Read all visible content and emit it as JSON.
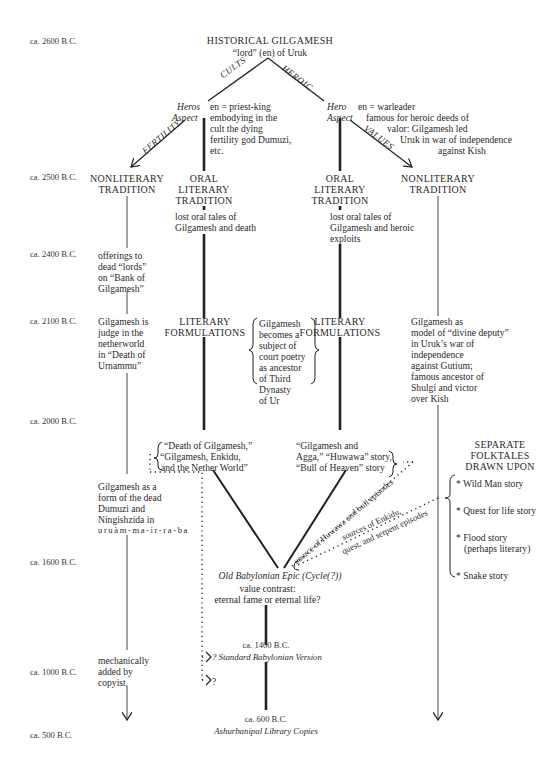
{
  "timeline": [
    {
      "label": "ca. 2600 B.C.",
      "y": 42
    },
    {
      "label": "ca. 2500 B.C.",
      "y": 178
    },
    {
      "label": "ca. 2400 B.C.",
      "y": 255
    },
    {
      "label": "ca. 2100 B.C.",
      "y": 321
    },
    {
      "label": "ca. 2000 B.C.",
      "y": 421
    },
    {
      "label": "ca. 1600 B.C.",
      "y": 563
    },
    {
      "label": "ca. 1000 B.C.",
      "y": 663
    },
    {
      "label": "ca. 500 B.C.",
      "y": 732
    }
  ],
  "root": {
    "title": "HISTORICAL GILGAMESH",
    "subtitle": "“lord” (en) of Uruk"
  },
  "branch_labels": {
    "cults": "CULTS",
    "heroic": "HEROIC",
    "fertility": "FERTILITY",
    "values": "VALUES"
  },
  "left_aspect": {
    "label_line1": "Heros",
    "label_line2": "Aspect",
    "desc": [
      "en = priest-king",
      "embodying in the",
      "cult the dying",
      "fertility god Dumuzi,",
      "etc."
    ]
  },
  "right_aspect": {
    "label_line1": "Hero",
    "label_line2": "Aspect",
    "desc": [
      "en = warleader",
      "famous for heroic deeds of",
      "valor: Gilgamesh led",
      "Uruk in war of independence",
      "against Kish"
    ]
  },
  "columns": {
    "nonliterary_left": {
      "title": [
        "NONLITERARY",
        "TRADITION"
      ],
      "c2400": [
        "offerings to",
        "dead “lords”",
        "on “Bank of",
        "Gilgamesh”"
      ],
      "c2100": [
        "Gilgamesh is",
        "judge in the",
        "netherworld",
        "in “Death of",
        "Urnammu”"
      ],
      "c1800": [
        "Gilgamesh as a",
        "form of the dead",
        "Dumuzi and",
        "Ningishzida in",
        "uruàm-ma-ir-ra-ba"
      ],
      "c1000": [
        "mechanically",
        "added by",
        "copyist"
      ]
    },
    "oral_left": {
      "title": [
        "ORAL",
        "LITERARY",
        "TRADITION"
      ],
      "desc": [
        "lost oral tales of",
        "Gilgamesh and death"
      ],
      "formulation": [
        "LITERARY",
        "FORMULATIONS"
      ],
      "c2000": [
        "“Death of Gilgamesh,”",
        "“Gilgamesh, Enkidu,",
        "and the Nether World”"
      ]
    },
    "court_poetry": [
      "Gilgamesh",
      "becomes a",
      "subject of",
      "court poetry",
      "as ancestor",
      "of Third",
      "Dynasty",
      "of Ur"
    ],
    "oral_right": {
      "title": [
        "ORAL",
        "LITERARY",
        "TRADITION"
      ],
      "desc": [
        "lost oral tales of",
        "Gilgamesh and heroic",
        "exploits"
      ],
      "formulation": [
        "LITERARY",
        "FORMULATIONS"
      ],
      "c2000": [
        "“Gilgamesh and",
        "Agga,” “Huwawa” story,",
        "“Bull of Heaven” story"
      ]
    },
    "nonliterary_right": {
      "title": [
        "NONLITERARY",
        "TRADITION"
      ],
      "c2100": [
        "Gilgamesh as",
        "model of “divine deputy”",
        "in Uruk’s war of",
        "independence",
        "against Gutium;",
        "famous ancestor of",
        "Shulgi and victor",
        "over Kish"
      ]
    }
  },
  "folktales": {
    "title": [
      "SEPARATE",
      "FOLKTALES",
      "DRAWN UPON"
    ],
    "items": [
      "* Wild Man story",
      "* Quest for life story",
      "* Flood story",
      "(perhaps literary)",
      "* Snake story"
    ]
  },
  "diagonal_labels": {
    "huwawa": "source of Huwawa and bull episodes",
    "enkidu_1": "sources of Enkidu,",
    "enkidu_2": "quest, and serpent episodes"
  },
  "epic": {
    "title": "Old Babylonian Epic (Cycle(?))",
    "line1": "value contrast:",
    "line2": "eternal fame or eternal life?"
  },
  "standard": {
    "date": "ca. 1400 B.C.",
    "title": "? Standard Babylonian Version",
    "q": "?"
  },
  "ashurbanipal": {
    "date": "ca. 600 B.C.",
    "title": "Ashurbanipal Library Copies"
  }
}
